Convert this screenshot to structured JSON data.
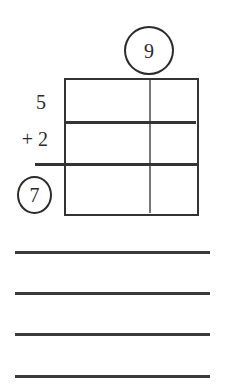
{
  "worksheet": {
    "carry_circle": {
      "value": "9"
    },
    "addend_top": "5",
    "addend_bottom": "+ 2",
    "result_circle": {
      "value": "7"
    },
    "grid": {
      "rows": 3,
      "columns": 2
    },
    "answer_lines": {
      "count": 4
    }
  },
  "colors": {
    "ink": "#2b2b2b",
    "background": "#ffffff"
  }
}
